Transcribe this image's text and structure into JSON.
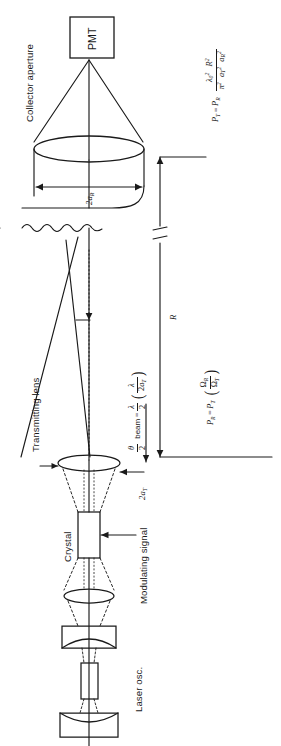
{
  "figure": {
    "orientation": "rotated-90",
    "ink_color": "#1a1a1a",
    "background": "#ffffff"
  },
  "labels": {
    "collector_aperture": "Collector aperture",
    "pmt": "PMT",
    "transmitting_lens": "Transmitting lens",
    "crystal": "Crystal",
    "modulating_signal": "Modulating signal",
    "laser_osc": "Laser osc.",
    "range_R": "R",
    "aperture_rx": "2a",
    "aperture_rx_sub": "R",
    "aperture_tx": "2a",
    "aperture_tx_sub": "T"
  },
  "equations": {
    "received_power": {
      "lhs": "P",
      "lhs_sub": "R",
      "eq": "=",
      "rhs_p": "P",
      "rhs_p_sub": "T",
      "frac_num": "Ω",
      "frac_num_sub": "R",
      "frac_den": "Ω",
      "frac_den_sub": "T",
      "plain": "P_R = P_T ( Ω_R / Ω_T )"
    },
    "transmit_power": {
      "lhs": "P",
      "lhs_sub": "T",
      "eq": "=",
      "rhs_p": "P",
      "rhs_p_sub": "R",
      "num_lambda": "λ",
      "num_lambda_sub": "0",
      "num_lambda_sup": "2",
      "num_R": "R",
      "num_R_sup": "2",
      "den_pi": "π",
      "den_pi_sup": "2",
      "den_aT": "a",
      "den_aT_sub": "T",
      "den_aT_sup": "2",
      "den_aR": "a",
      "den_aR_sub": "R",
      "den_aR_sup": "2",
      "plain": "P_T = P_R  λ₀² R² / ( π² a_T² a_R² )"
    },
    "beam_divergence": {
      "theta": "θ",
      "over": "2",
      "word": "beam",
      "eq": "=",
      "f1_num": "λ",
      "f1_den": "2",
      "f2_num": "λ",
      "f2_den_2": "2",
      "f2_den_a": "a",
      "f2_den_sub": "T",
      "plain": "θ/2 beam = λ/2 ( λ / 2a_T )"
    }
  },
  "components": [
    {
      "name": "pmt-detector",
      "label": "PMT"
    },
    {
      "name": "collector-aperture-lens",
      "label": "Collector aperture"
    },
    {
      "name": "transmitting-lens",
      "label": "Transmitting lens"
    },
    {
      "name": "crystal-modulator",
      "label": "Crystal"
    },
    {
      "name": "beam-expander-lens",
      "label": ""
    },
    {
      "name": "laser-cavity-mirror-output",
      "label": ""
    },
    {
      "name": "laser-gain-rod",
      "label": ""
    },
    {
      "name": "laser-cavity-mirror-rear",
      "label": ""
    }
  ]
}
